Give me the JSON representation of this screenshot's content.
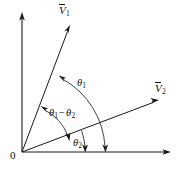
{
  "figure": {
    "background_color": "#ffffff",
    "stroke_color": "#1a1a1a",
    "origin_label": "0",
    "axes": {
      "vertical_name": "vertical-axis",
      "horizontal_name": "horizontal-axis"
    },
    "vectors": [
      {
        "id": "v1",
        "symbol": "V",
        "subscript": "1",
        "overbar": true,
        "angle_label": "theta-1"
      },
      {
        "id": "v2",
        "symbol": "V",
        "subscript": "2",
        "overbar": true,
        "angle_label": "theta-2"
      }
    ],
    "angles": [
      {
        "id": "theta1",
        "symbol": "θ",
        "subscript": "1",
        "between": "x-axis and V1",
        "arrowheads": "double"
      },
      {
        "id": "theta1_minus_theta2",
        "symbol": "θ",
        "subscript": "1",
        "operator": "−",
        "symbol2": "θ",
        "subscript2": "2",
        "between": "V2 and V1",
        "arrowheads": "double"
      },
      {
        "id": "theta2",
        "symbol": "θ",
        "subscript": "2",
        "between": "x-axis and V2",
        "arrowheads": "double"
      }
    ]
  }
}
